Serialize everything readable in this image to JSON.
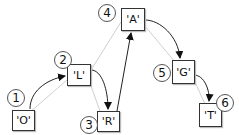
{
  "diagram": {
    "type": "tree-traversal",
    "nodes": [
      {
        "id": "n1",
        "order": "1",
        "label": "'O'",
        "box": [
          12,
          110,
          23,
          21
        ],
        "circle": [
          16,
          98
        ]
      },
      {
        "id": "n2",
        "order": "2",
        "label": "'L'",
        "box": [
          67,
          64,
          24,
          22
        ],
        "circle": [
          63,
          60
        ]
      },
      {
        "id": "n3",
        "order": "3",
        "label": "'R'",
        "box": [
          97,
          111,
          23,
          21
        ],
        "circle": [
          89,
          125
        ]
      },
      {
        "id": "n4",
        "order": "4",
        "label": "'A'",
        "box": [
          121,
          8,
          24,
          23
        ],
        "circle": [
          107,
          13
        ]
      },
      {
        "id": "n5",
        "order": "5",
        "label": "'G'",
        "box": [
          172,
          60,
          23,
          24
        ],
        "circle": [
          162,
          73
        ]
      },
      {
        "id": "n6",
        "order": "6",
        "label": "'T'",
        "box": [
          199,
          103,
          23,
          24
        ],
        "circle": [
          225,
          103
        ]
      }
    ],
    "tree_edges": [
      [
        "n4",
        "n2"
      ],
      [
        "n2",
        "n1"
      ],
      [
        "n2",
        "n3"
      ],
      [
        "n4",
        "n5"
      ],
      [
        "n5",
        "n6"
      ]
    ],
    "traversal_arrows": [
      [
        "n1",
        "n2"
      ],
      [
        "n2",
        "n3"
      ],
      [
        "n3",
        "n4"
      ],
      [
        "n4",
        "n5"
      ],
      [
        "n5",
        "n6"
      ]
    ],
    "colors": {
      "tree_edge": "#cccccc",
      "arrow": "#222222",
      "box_border": "#333333"
    }
  }
}
